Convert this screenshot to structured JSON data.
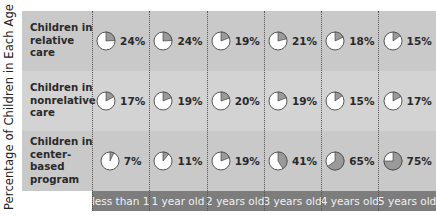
{
  "chart_data": {
    "type": "table",
    "title": "",
    "ylabel": "Percentage of Children in Each Age Group*",
    "xlabel": "",
    "categories": [
      "less than 1",
      "1 year old",
      "2 years old",
      "3 years old",
      "4 years old",
      "5 years old"
    ],
    "series": [
      {
        "name": "Children in relative care",
        "values": [
          24,
          24,
          19,
          21,
          18,
          15
        ]
      },
      {
        "name": "Children in nonrelative care",
        "values": [
          17,
          19,
          20,
          19,
          15,
          17
        ]
      },
      {
        "name": "Children in center-based program",
        "values": [
          7,
          11,
          19,
          41,
          65,
          75
        ]
      }
    ],
    "cell_glyph": "pie",
    "pie_fill_color": "#9a9a9a",
    "pie_empty_color": "#ffffff"
  },
  "ylabel": "Percentage of Children in Each Age Group*",
  "rows": [
    {
      "label": "Children in relative care",
      "cells": [
        "24%",
        "24%",
        "19%",
        "21%",
        "18%",
        "15%"
      ]
    },
    {
      "label": "Children in nonrelative care",
      "cells": [
        "17%",
        "19%",
        "20%",
        "19%",
        "15%",
        "17%"
      ]
    },
    {
      "label": "Children in center-based program",
      "cells": [
        "7%",
        "11%",
        "19%",
        "41%",
        "65%",
        "75%"
      ]
    }
  ],
  "columns": [
    "less than 1",
    "1 year old",
    "2 years old",
    "3 years old",
    "4 years old",
    "5 years old"
  ],
  "colors": {
    "row_dark": "#c9c9c9",
    "row_light": "#d3d3d3",
    "axis_bar": "#7d7d7d",
    "axis_text": "#f0f0f0",
    "pie_fill": "#9a9a9a"
  }
}
